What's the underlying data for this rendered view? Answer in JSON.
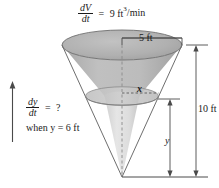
{
  "figure": {
    "annotations": {
      "volume_rate": {
        "numerator": "dV",
        "denominator": "dt",
        "equals": "=",
        "value": "9 ft",
        "exponent": "3",
        "per_unit": "/min",
        "full_text": "dV/dt = 9 ft3/min"
      },
      "height_rate": {
        "numerator": "dy",
        "denominator": "dt",
        "equals": "=",
        "value": "?",
        "full_text": "dy/dt = ?"
      },
      "condition": {
        "text": "when y = 6 ft"
      }
    },
    "dimensions": [
      {
        "name": "top-radius",
        "label": "5 ft",
        "value": 5,
        "unit": "ft"
      },
      {
        "name": "cone-height",
        "label": "10 ft",
        "value": 10,
        "unit": "ft"
      },
      {
        "name": "water-height",
        "label": "y",
        "value": null,
        "unit": "ft"
      },
      {
        "name": "water-radius",
        "label": "x",
        "value": null,
        "unit": "ft"
      }
    ],
    "colors": {
      "cone_upper_fill": "#b6b6b6",
      "cone_lower_fill": "#dcdcdc",
      "top_ellipse_fill": "#b0b0b0",
      "water_surface_fill": "#c4c4c4",
      "outline": "#6e6e6e",
      "text": "#1a1a1a",
      "background": "#ffffff"
    },
    "geometry": {
      "apex_x": 122,
      "apex_y": 177,
      "top_center_y": 45,
      "top_radius_px": 60,
      "ellipse_ry": 15,
      "water_level_y": 96
    }
  }
}
